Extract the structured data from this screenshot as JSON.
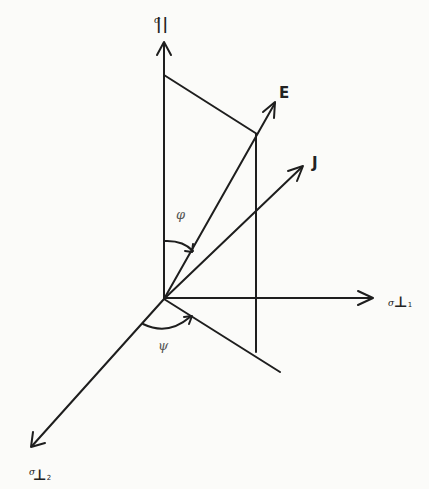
{
  "figure": {
    "axes": {
      "vertical": {
        "symbol": "σ",
        "subscript": "||"
      },
      "horizontal": {
        "symbol": "σ",
        "subscript": "⊥",
        "index": "1"
      },
      "diagonal": {
        "symbol": "σ",
        "subscript": "⊥",
        "index": "2"
      }
    },
    "vectors": [
      {
        "label": "E"
      },
      {
        "label": "J"
      }
    ],
    "angles": [
      {
        "label": "φ"
      },
      {
        "label": "ψ"
      }
    ],
    "colors": {
      "ink": "#1e1e1e",
      "paper": "#fbfbf9"
    }
  }
}
